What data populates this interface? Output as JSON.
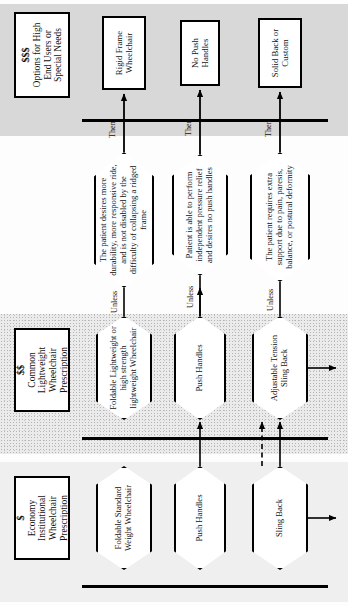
{
  "diagram": {
    "orientation": "rotated-90",
    "tiers": [
      {
        "id": "economy",
        "money": "$",
        "caption_lines": [
          "Economy",
          "Institutional",
          "Wheelchair",
          "Prescription"
        ]
      },
      {
        "id": "common",
        "money": "$$",
        "caption_lines": [
          "Common",
          "Lightweight",
          "Wheelchair",
          "Prescription"
        ]
      },
      {
        "id": "premium",
        "money": "$$$",
        "caption_lines": [
          "Options for High",
          "End Users or",
          "Special Needs"
        ]
      }
    ],
    "rows": [
      {
        "id": "frame",
        "economy_node": "Foldable Standard Weight Wheelchair",
        "common_node": "Foldable Lightweight or high strength lightweight Wheelchair",
        "condition": "The patient desires more durability, more responsive ride, and is not disabled by the difficulty of collapsing a ridged frame",
        "result": "Rigid Frame Wheelchair",
        "unless_label": "Unless",
        "then_label": "Then"
      },
      {
        "id": "handles",
        "economy_node": "Push Handles",
        "common_node": "Push Handles",
        "condition": "Patient is able to perform independent pressure relief and desires no push handles",
        "result": "No Push Handles",
        "unless_label": "Unless",
        "then_label": "Then"
      },
      {
        "id": "back",
        "economy_node": "Sling Back",
        "common_node": "Adjustable Tension Sling Back",
        "condition": "The patient requires extra support due to pain, paresis, balance, or postural deformity",
        "result": "Solid Back or Custom",
        "unless_label": "Unless",
        "then_label": "Then"
      }
    ],
    "colors": {
      "ink": "#000000",
      "economy_band": "#efefef",
      "common_band": "#ebebeb",
      "premium_band": "#d8d8d8",
      "paper": "#ffffff"
    }
  }
}
